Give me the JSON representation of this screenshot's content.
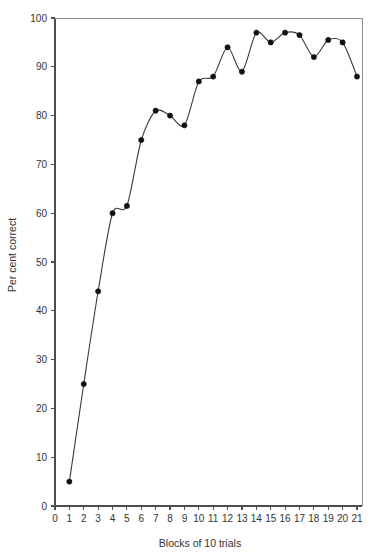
{
  "chart_data": {
    "type": "line",
    "title": "",
    "xlabel": "Blocks of 10 trials",
    "ylabel": "Per cent correct",
    "xlim": [
      0,
      21
    ],
    "ylim": [
      0,
      100
    ],
    "grid": false,
    "legend": "none",
    "x_ticks": [
      "0",
      "1",
      "2",
      "3",
      "4",
      "5",
      "6",
      "7",
      "8",
      "9",
      "10",
      "11",
      "12",
      "13",
      "14",
      "15",
      "16",
      "17",
      "18",
      "19",
      "20",
      "21"
    ],
    "y_ticks": [
      "0",
      "10",
      "20",
      "30",
      "40",
      "50",
      "60",
      "70",
      "80",
      "90",
      "100"
    ],
    "x": [
      1,
      2,
      3,
      4,
      5,
      6,
      7,
      8,
      9,
      10,
      11,
      12,
      13,
      14,
      15,
      16,
      17,
      18,
      19,
      20,
      21
    ],
    "values": [
      5,
      25,
      44,
      60,
      61.5,
      75,
      81,
      80,
      78,
      87,
      88,
      94,
      89,
      97,
      95,
      97,
      96.5,
      92,
      95.5,
      95,
      88
    ],
    "series": [
      {
        "name": "Per cent correct",
        "marker": "filled-circle",
        "line_color": "#3a3a3a",
        "marker_color": "#111111",
        "values": [
          5,
          25,
          44,
          60,
          61.5,
          75,
          81,
          80,
          78,
          87,
          88,
          94,
          89,
          97,
          95,
          97,
          96.5,
          92,
          95.5,
          95,
          88
        ]
      }
    ]
  },
  "axes": {
    "y_axis_label": "Per cent correct",
    "x_axis_label": "Blocks of 10 trials"
  }
}
